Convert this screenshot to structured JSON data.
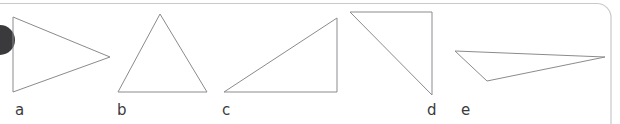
{
  "figure": {
    "kind": "geometry-figure",
    "width": 620,
    "height": 124,
    "background_color": "#ffffff",
    "stroke_color": "#8b8b8f",
    "stroke_width": 1,
    "label_color": "#3b3b3d",
    "label_font_size": 15
  },
  "page_frame": {
    "border_color": "#c9c9cd",
    "corner_radius": 14,
    "bullet": {
      "name": "bullet-dot",
      "color": "#3a3a3c",
      "center_x": 0,
      "center_y": 40,
      "radius": 15
    }
  },
  "shapes": [
    {
      "id": "a",
      "label": "a",
      "type": "triangle",
      "orientation": "right-pointing isoceles",
      "points": "13,17 110,57 13,92",
      "label_x": 15,
      "label_y": 103
    },
    {
      "id": "b",
      "label": "b",
      "type": "triangle",
      "orientation": "upright isoceles",
      "points": "160,14 207,92 118,92",
      "label_x": 117,
      "label_y": 103
    },
    {
      "id": "c",
      "label": "c",
      "type": "triangle",
      "orientation": "right triangle, right angle bottom-right",
      "points": "337,18 337,92 224,92",
      "label_x": 222,
      "label_y": 103
    },
    {
      "id": "d",
      "label": "d",
      "type": "triangle",
      "orientation": "right triangle, right angle top-right",
      "points": "350,12 432,12 432,95",
      "label_x": 427,
      "label_y": 103
    },
    {
      "id": "e",
      "label": "e",
      "type": "triangle",
      "orientation": "thin obtuse, apex bottom-left",
      "points": "455,51 605,57 487,81",
      "label_x": 461,
      "label_y": 103
    }
  ]
}
